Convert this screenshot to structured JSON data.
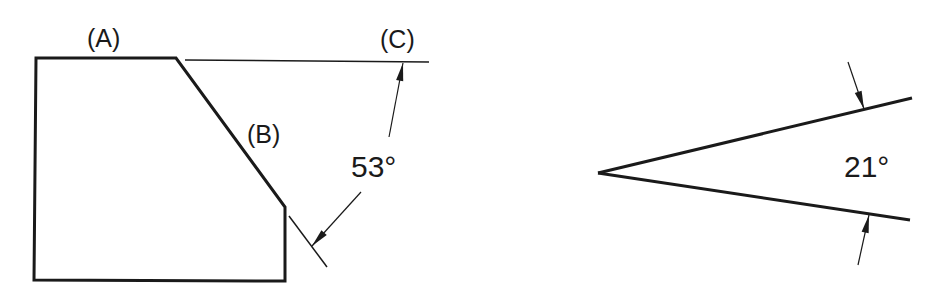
{
  "figure": {
    "left_view": {
      "labels": {
        "a": "(A)",
        "b": "(B)",
        "c": "(C)"
      },
      "angle_label": "53°",
      "angle_value_deg": 53
    },
    "right_view": {
      "angle_label": "21°",
      "angle_value_deg": 21
    },
    "colors": {
      "stroke": "#1a1a1a",
      "background": "#ffffff"
    }
  }
}
